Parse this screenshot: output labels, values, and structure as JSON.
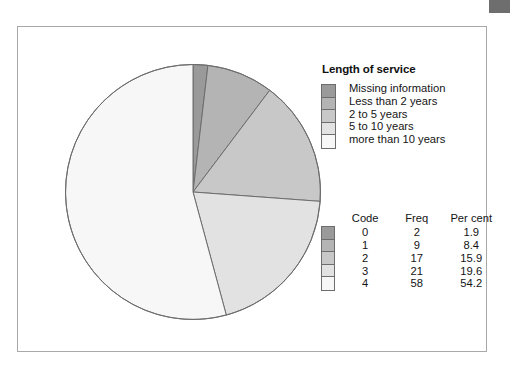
{
  "chart_data": {
    "type": "pie",
    "title": "Length of service",
    "categories": [
      "Missing information",
      "Less than 2 years",
      "2 to 5 years",
      "5 to 10 years",
      "more than 10 years"
    ],
    "codes": [
      "0",
      "1",
      "2",
      "3",
      "4"
    ],
    "values": [
      2,
      9,
      17,
      21,
      58
    ],
    "percents": [
      1.9,
      8.4,
      15.9,
      19.6,
      54.2
    ],
    "total": 107,
    "start_angle_deg": 0,
    "direction": "clockwise",
    "slice_colors": [
      "#9a9a9a",
      "#b4b4b4",
      "#c8c8c8",
      "#e2e2e2",
      "#f7f7f7"
    ],
    "slice_border_color": "#6d6d6d",
    "legend_position": "right"
  },
  "legend": {
    "title": "Length of service",
    "items": [
      {
        "label": "Missing information",
        "color": "#9a9a9a"
      },
      {
        "label": "Less than 2 years",
        "color": "#b4b4b4"
      },
      {
        "label": "2 to 5 years",
        "color": "#c8c8c8"
      },
      {
        "label": "5 to 10 years",
        "color": "#e2e2e2"
      },
      {
        "label": "more than 10 years",
        "color": "#f7f7f7"
      }
    ]
  },
  "table": {
    "headers": {
      "code": "Code",
      "freq": "Freq",
      "percent": "Per cent"
    },
    "rows": [
      {
        "code": "0",
        "freq": "2",
        "percent": "1.9",
        "color": "#9a9a9a"
      },
      {
        "code": "1",
        "freq": "9",
        "percent": "8.4",
        "color": "#b4b4b4"
      },
      {
        "code": "2",
        "freq": "17",
        "percent": "15.9",
        "color": "#c8c8c8"
      },
      {
        "code": "3",
        "freq": "21",
        "percent": "19.6",
        "color": "#e2e2e2"
      },
      {
        "code": "4",
        "freq": "58",
        "percent": "54.2",
        "color": "#f7f7f7"
      }
    ]
  },
  "frame": {
    "border_color": "#a8a8a8",
    "artifact_color": "#6e6e6e"
  }
}
